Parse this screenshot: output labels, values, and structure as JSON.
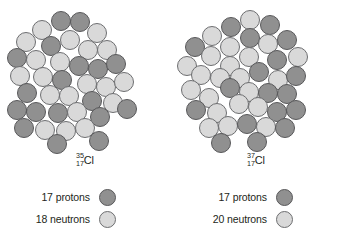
{
  "figure": {
    "colors": {
      "proton": "#909090",
      "proton_outline": "#58585a",
      "neutron": "#d9d9d9",
      "neutron_outline": "#6d6e70",
      "background": "#ffffff",
      "text": "#231f20"
    },
    "particle_diameter_px": 19
  },
  "panels": [
    {
      "id": "cl35",
      "isotope": {
        "mass_number": "35",
        "atomic_number": "17",
        "symbol": "Cl"
      },
      "legend": [
        {
          "count_label": "17 protons",
          "particle": "proton"
        },
        {
          "count_label": "18 neutrons",
          "particle": "neutron"
        }
      ],
      "nucleus": {
        "protons": 17,
        "neutrons": 18,
        "total_nucleons": 35,
        "particles": [
          {
            "cx": 61,
            "cy": 21,
            "type": "proton"
          },
          {
            "cx": 80,
            "cy": 22,
            "type": "proton"
          },
          {
            "cx": 42,
            "cy": 30,
            "type": "neutron"
          },
          {
            "cx": 97,
            "cy": 33,
            "type": "neutron"
          },
          {
            "cx": 26,
            "cy": 42,
            "type": "neutron"
          },
          {
            "cx": 51,
            "cy": 46,
            "type": "proton"
          },
          {
            "cx": 70,
            "cy": 40,
            "type": "neutron"
          },
          {
            "cx": 88,
            "cy": 50,
            "type": "neutron"
          },
          {
            "cx": 107,
            "cy": 50,
            "type": "neutron"
          },
          {
            "cx": 17,
            "cy": 58,
            "type": "proton"
          },
          {
            "cx": 36,
            "cy": 60,
            "type": "neutron"
          },
          {
            "cx": 60,
            "cy": 62,
            "type": "neutron"
          },
          {
            "cx": 79,
            "cy": 66,
            "type": "proton"
          },
          {
            "cx": 98,
            "cy": 69,
            "type": "proton"
          },
          {
            "cx": 116,
            "cy": 64,
            "type": "proton"
          },
          {
            "cx": 20,
            "cy": 76,
            "type": "neutron"
          },
          {
            "cx": 43,
            "cy": 77,
            "type": "neutron"
          },
          {
            "cx": 62,
            "cy": 80,
            "type": "proton"
          },
          {
            "cx": 87,
            "cy": 84,
            "type": "neutron"
          },
          {
            "cx": 106,
            "cy": 87,
            "type": "neutron"
          },
          {
            "cx": 124,
            "cy": 82,
            "type": "neutron"
          },
          {
            "cx": 27,
            "cy": 93,
            "type": "proton"
          },
          {
            "cx": 50,
            "cy": 95,
            "type": "neutron"
          },
          {
            "cx": 69,
            "cy": 96,
            "type": "neutron"
          },
          {
            "cx": 92,
            "cy": 101,
            "type": "proton"
          },
          {
            "cx": 113,
            "cy": 103,
            "type": "neutron"
          },
          {
            "cx": 17,
            "cy": 110,
            "type": "proton"
          },
          {
            "cx": 36,
            "cy": 112,
            "type": "proton"
          },
          {
            "cx": 58,
            "cy": 113,
            "type": "proton"
          },
          {
            "cx": 77,
            "cy": 112,
            "type": "neutron"
          },
          {
            "cx": 100,
            "cy": 117,
            "type": "proton"
          },
          {
            "cx": 127,
            "cy": 109,
            "type": "proton"
          },
          {
            "cx": 24,
            "cy": 128,
            "type": "proton"
          },
          {
            "cx": 45,
            "cy": 130,
            "type": "neutron"
          },
          {
            "cx": 66,
            "cy": 131,
            "type": "neutron"
          },
          {
            "cx": 85,
            "cy": 128,
            "type": "neutron"
          },
          {
            "cx": 57,
            "cy": 144,
            "type": "proton"
          },
          {
            "cx": 99,
            "cy": 141,
            "type": "proton"
          }
        ]
      }
    },
    {
      "id": "cl37",
      "isotope": {
        "mass_number": "37",
        "atomic_number": "17",
        "symbol": "Cl"
      },
      "legend": [
        {
          "count_label": "17 protons",
          "particle": "proton"
        },
        {
          "count_label": "20 neutrons",
          "particle": "neutron"
        }
      ],
      "nucleus": {
        "protons": 17,
        "neutrons": 20,
        "total_nucleons": 37,
        "particles": [
          {
            "cx": 79,
            "cy": 20,
            "type": "neutron"
          },
          {
            "cx": 60,
            "cy": 27,
            "type": "proton"
          },
          {
            "cx": 99,
            "cy": 25,
            "type": "proton"
          },
          {
            "cx": 41,
            "cy": 36,
            "type": "neutron"
          },
          {
            "cx": 79,
            "cy": 38,
            "type": "proton"
          },
          {
            "cx": 97,
            "cy": 44,
            "type": "neutron"
          },
          {
            "cx": 116,
            "cy": 40,
            "type": "proton"
          },
          {
            "cx": 24,
            "cy": 47,
            "type": "proton"
          },
          {
            "cx": 59,
            "cy": 47,
            "type": "neutron"
          },
          {
            "cx": 40,
            "cy": 56,
            "type": "neutron"
          },
          {
            "cx": 78,
            "cy": 57,
            "type": "neutron"
          },
          {
            "cx": 106,
            "cy": 60,
            "type": "proton"
          },
          {
            "cx": 127,
            "cy": 57,
            "type": "neutron"
          },
          {
            "cx": 16,
            "cy": 66,
            "type": "neutron"
          },
          {
            "cx": 59,
            "cy": 66,
            "type": "neutron"
          },
          {
            "cx": 88,
            "cy": 72,
            "type": "proton"
          },
          {
            "cx": 30,
            "cy": 75,
            "type": "neutron"
          },
          {
            "cx": 49,
            "cy": 78,
            "type": "neutron"
          },
          {
            "cx": 69,
            "cy": 78,
            "type": "neutron"
          },
          {
            "cx": 107,
            "cy": 80,
            "type": "neutron"
          },
          {
            "cx": 125,
            "cy": 76,
            "type": "proton"
          },
          {
            "cx": 20,
            "cy": 90,
            "type": "neutron"
          },
          {
            "cx": 59,
            "cy": 88,
            "type": "proton"
          },
          {
            "cx": 78,
            "cy": 92,
            "type": "neutron"
          },
          {
            "cx": 97,
            "cy": 93,
            "type": "proton"
          },
          {
            "cx": 116,
            "cy": 94,
            "type": "proton"
          },
          {
            "cx": 38,
            "cy": 98,
            "type": "neutron"
          },
          {
            "cx": 68,
            "cy": 104,
            "type": "neutron"
          },
          {
            "cx": 87,
            "cy": 107,
            "type": "neutron"
          },
          {
            "cx": 25,
            "cy": 110,
            "type": "proton"
          },
          {
            "cx": 46,
            "cy": 113,
            "type": "neutron"
          },
          {
            "cx": 106,
            "cy": 112,
            "type": "proton"
          },
          {
            "cx": 125,
            "cy": 110,
            "type": "proton"
          },
          {
            "cx": 38,
            "cy": 128,
            "type": "neutron"
          },
          {
            "cx": 57,
            "cy": 126,
            "type": "neutron"
          },
          {
            "cx": 76,
            "cy": 124,
            "type": "proton"
          },
          {
            "cx": 95,
            "cy": 127,
            "type": "neutron"
          },
          {
            "cx": 114,
            "cy": 128,
            "type": "proton"
          },
          {
            "cx": 50,
            "cy": 143,
            "type": "proton"
          },
          {
            "cx": 86,
            "cy": 142,
            "type": "proton"
          }
        ]
      }
    }
  ]
}
